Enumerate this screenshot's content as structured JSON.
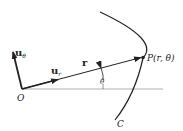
{
  "diagram": {
    "labels": {
      "u_theta_base": "u",
      "u_theta_sub": "θ",
      "u_r_base": "u",
      "u_r_sub": "r",
      "r": "r",
      "origin": "O",
      "point": "P(r, θ)",
      "theta": "θ",
      "curve": "C"
    },
    "colors": {
      "stroke": "#222222",
      "axis": "#888888"
    }
  }
}
